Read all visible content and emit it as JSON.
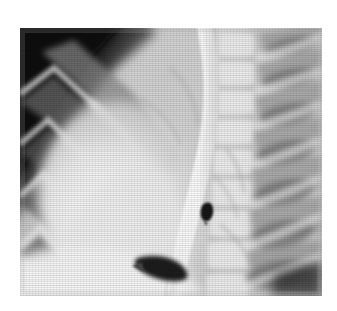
{
  "image": {
    "kind": "radiograph",
    "modality_label": "X-ray",
    "view_label": "lateral chest radiograph",
    "border_color": "#ffffff",
    "film_base_color": "#cfcfcf",
    "plate": {
      "x": 20,
      "y": 28,
      "width": 302,
      "height": 268
    }
  },
  "anatomy": {
    "regions": [
      {
        "name": "axilla-dark-corner",
        "label": "axillary soft-tissue free air shadow",
        "tone": "#0d0d0d"
      },
      {
        "name": "anterior-ribs",
        "label": "anterior rib shadows",
        "tone": "#8d8d8d"
      },
      {
        "name": "posterior-ribs",
        "label": "posterior rib shadows",
        "tone": "#9a9a9a"
      },
      {
        "name": "vertebral-column",
        "label": "thoracic vertebral bodies",
        "tone": "#e6e6e6"
      },
      {
        "name": "barium-esophagus",
        "label": "contrast-filled esophagus",
        "tone": "#f4f4f4"
      },
      {
        "name": "cardiac-silhouette",
        "label": "cardiac / mediastinal silhouette",
        "tone": "#ececec"
      },
      {
        "name": "diaphragm",
        "label": "hemidiaphragm",
        "tone": "#f0f0f0"
      },
      {
        "name": "retrocardiac-lucency",
        "label": "retrocardiac lucency",
        "tone": "#6e6e6e"
      }
    ],
    "findings": [
      {
        "name": "radiolucent-foreign-body",
        "label": "focal rounded radiolucent density",
        "tone": "#161616",
        "center_x": 203,
        "center_y": 211,
        "width": 11,
        "height": 14
      },
      {
        "name": "subdiaphragmatic-air-wedge",
        "label": "wedge-shaped lucency below contrast column",
        "tone": "#2a2a2a",
        "center_x": 162,
        "center_y": 264,
        "width": 52,
        "height": 22
      }
    ]
  },
  "annotations": {
    "top_left_marker": "",
    "bottom_right_marker": ""
  }
}
